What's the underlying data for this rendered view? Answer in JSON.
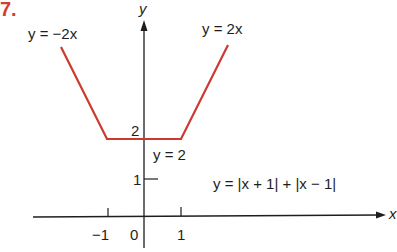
{
  "problem_number": "7.",
  "colors": {
    "graph": "#cc3a2f",
    "axes": "#1e1e1e",
    "number": "#d0402e"
  },
  "axes": {
    "x_label": "x",
    "y_label": "y"
  },
  "ticks": {
    "x": [
      {
        "value": -1,
        "label": "−1"
      },
      {
        "value": 0,
        "label": "0"
      },
      {
        "value": 1,
        "label": "1"
      }
    ],
    "y": [
      {
        "value": 1,
        "label": "1"
      },
      {
        "value": 2,
        "label": "2"
      }
    ]
  },
  "annotations": {
    "left_branch": "y = −2x",
    "right_branch": "y = 2x",
    "middle": "y = 2",
    "function": "y = |x + 1| + |x − 1|"
  },
  "function": {
    "expression": "y = |x + 1| + |x - 1|",
    "pieces": [
      {
        "formula": "y = -2x",
        "domain": "x <= -1"
      },
      {
        "formula": "y = 2",
        "domain": "-1 <= x <= 1"
      },
      {
        "formula": "y = 2x",
        "domain": "x >= 1"
      }
    ]
  }
}
